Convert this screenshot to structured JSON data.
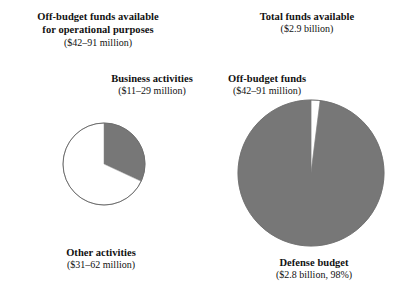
{
  "figure": {
    "background": "#ffffff",
    "wedge_fill": "#777777",
    "wedge_empty_fill": "#ffffff",
    "outline": "#6e6e6e"
  },
  "labels": {
    "offbudget_operational": {
      "line1": "Off-budget funds available",
      "line2": "for operational purposes",
      "amount": "($42–91 million)"
    },
    "total_funds": {
      "line1": "Total funds available",
      "amount": "($2.9 billion)"
    },
    "business_activities": {
      "line1": "Business activities",
      "amount": "($11–29 million)"
    },
    "offbudget_funds": {
      "line1": "Off-budget funds",
      "amount": "($42–91 million)"
    },
    "other_activities": {
      "line1": "Other activities",
      "amount": "($31–62 million)"
    },
    "defense_budget": {
      "line1": "Defense budget",
      "amount": "($2.8 billion, 98%)"
    }
  },
  "chart_data": [
    {
      "type": "pie",
      "name": "off-budget-funds-breakdown",
      "title": "Off-budget funds available for operational purposes",
      "subtitle": "($42–91 million)",
      "total_label": "$42–91 million",
      "center": [
        46,
        46
      ],
      "radius": 41,
      "start_angle_deg": 0,
      "legend_position": "outside",
      "slices": [
        {
          "label": "Business activities",
          "value_label": "($11–29 million)",
          "value_low": 11,
          "value_high": 29,
          "percent": 32,
          "fill": "#777777",
          "start_deg": 0,
          "end_deg": 115
        },
        {
          "label": "Other activities",
          "value_label": "($31–62 million)",
          "value_low": 31,
          "value_high": 62,
          "percent": 68,
          "fill": "#ffffff",
          "start_deg": 115,
          "end_deg": 360
        }
      ]
    },
    {
      "type": "pie",
      "name": "total-funds-breakdown",
      "title": "Total funds available",
      "subtitle": "($2.9 billion)",
      "total_label": "$2.9 billion",
      "center": [
        79,
        79
      ],
      "radius": 73,
      "start_angle_deg": 0,
      "legend_position": "outside",
      "slices": [
        {
          "label": "Off-budget funds",
          "value_label": "($42–91 million)",
          "value_low": 42,
          "value_high": 91,
          "percent": 2,
          "fill": "#ffffff",
          "start_deg": 0,
          "end_deg": 7.2
        },
        {
          "label": "Defense budget",
          "value_label": "($2.8 billion, 98%)",
          "value": 2.8,
          "percent": 98,
          "fill": "#777777",
          "start_deg": 7.2,
          "end_deg": 360
        }
      ]
    }
  ]
}
